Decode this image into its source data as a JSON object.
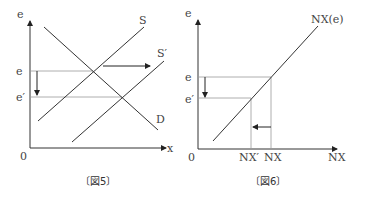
{
  "figures": [
    {
      "caption": "〔図5〕",
      "y_axis_label": "e",
      "x_axis_label": "x",
      "origin_label": "0",
      "level_labels": {
        "e": "e",
        "e_prime": "e′"
      },
      "curves": {
        "S": "S",
        "S_prime": "S′",
        "D": "D"
      }
    },
    {
      "caption": "〔図6〕",
      "y_axis_label": "e",
      "x_axis_label": "NX",
      "origin_label": "0",
      "level_labels": {
        "e": "e",
        "e_prime": "e′"
      },
      "x_ticks": {
        "nx_prime": "NX′",
        "nx": "NX"
      },
      "curves": {
        "NX_e": "NX(e)"
      }
    }
  ]
}
